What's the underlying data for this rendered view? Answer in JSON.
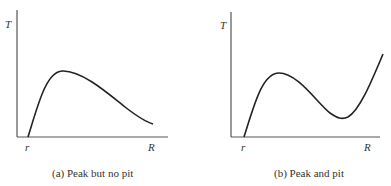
{
  "panels": [
    {
      "id": "a",
      "caption": "(a) Peak but no pit",
      "y_label": "T",
      "x_start_label": "r",
      "x_end_label": "R",
      "curve_path": "M28,137 C38,105 46,72 62,71 C82,70 110,95 125,107 C138,117 146,122 153,124"
    },
    {
      "id": "b",
      "caption": "(b) Peak and pit",
      "y_label": "T",
      "x_start_label": "r",
      "x_end_label": "R",
      "curve_path": "M244,137 C254,106 262,73 279,73 C298,73 318,104 330,113 C337,118 342,120 348,117 C360,110 372,80 383,54"
    }
  ],
  "colors": {
    "axis": "#555555",
    "curve": "#222222",
    "text": "#333333"
  }
}
